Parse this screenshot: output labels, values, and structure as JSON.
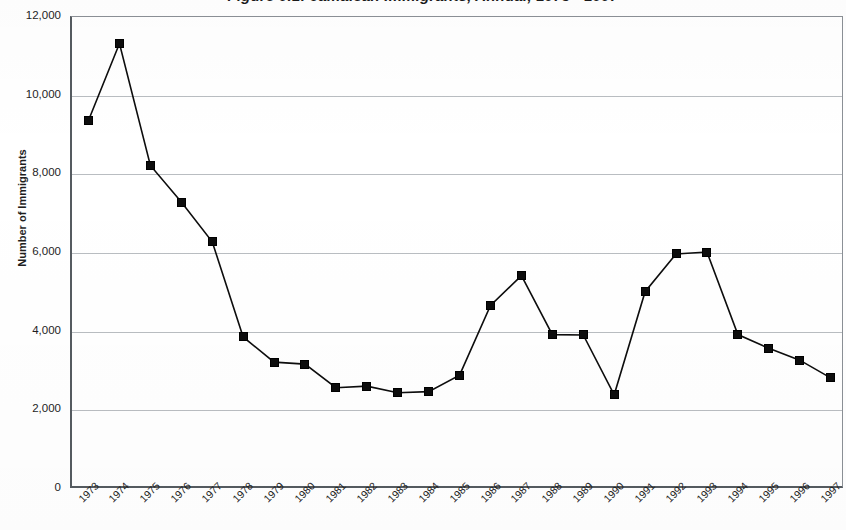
{
  "chart_data": {
    "type": "line",
    "title": "Figure 9.1: Jamaican Immigrants, Annual, 1973 - 1997",
    "xlabel": "",
    "ylabel": "Number of Immigrants",
    "categories": [
      "1973",
      "1974",
      "1975",
      "1976",
      "1977",
      "1978",
      "1979",
      "1980",
      "1981",
      "1982",
      "1983",
      "1984",
      "1985",
      "1986",
      "1987",
      "1988",
      "1989",
      "1990",
      "1991",
      "1992",
      "1993",
      "1994",
      "1995",
      "1996",
      "1997"
    ],
    "values": [
      9350,
      11300,
      8200,
      7270,
      6260,
      3840,
      3200,
      3150,
      2550,
      2590,
      2420,
      2450,
      2870,
      4640,
      5400,
      3900,
      3890,
      2370,
      4990,
      5950,
      6000,
      3900,
      3550,
      3250,
      2800
    ],
    "series": [
      {
        "name": "Jamaican Immigrants",
        "values": [
          9350,
          11300,
          8200,
          7270,
          6260,
          3840,
          3200,
          3150,
          2550,
          2590,
          2420,
          2450,
          2870,
          4640,
          5400,
          3900,
          3890,
          2370,
          4990,
          5950,
          6000,
          3900,
          3550,
          3250,
          2800
        ]
      }
    ],
    "ylim": [
      0,
      12000
    ],
    "ytick_labels": [
      "12,000",
      "10,000",
      "8,000",
      "6,000",
      "4,000",
      "2,000",
      "0"
    ],
    "ytick_values": [
      12000,
      10000,
      8000,
      6000,
      4000,
      2000,
      0
    ],
    "grid": "horizontal",
    "legend": "none",
    "marker": "filled-square",
    "line_color": "#0d0d0d",
    "marker_color": "#0d0d0d",
    "grid_color": "#b9bdc1",
    "axis_color": "#555b60",
    "background_color": "#ffffff",
    "xtick_rotation": -45
  }
}
